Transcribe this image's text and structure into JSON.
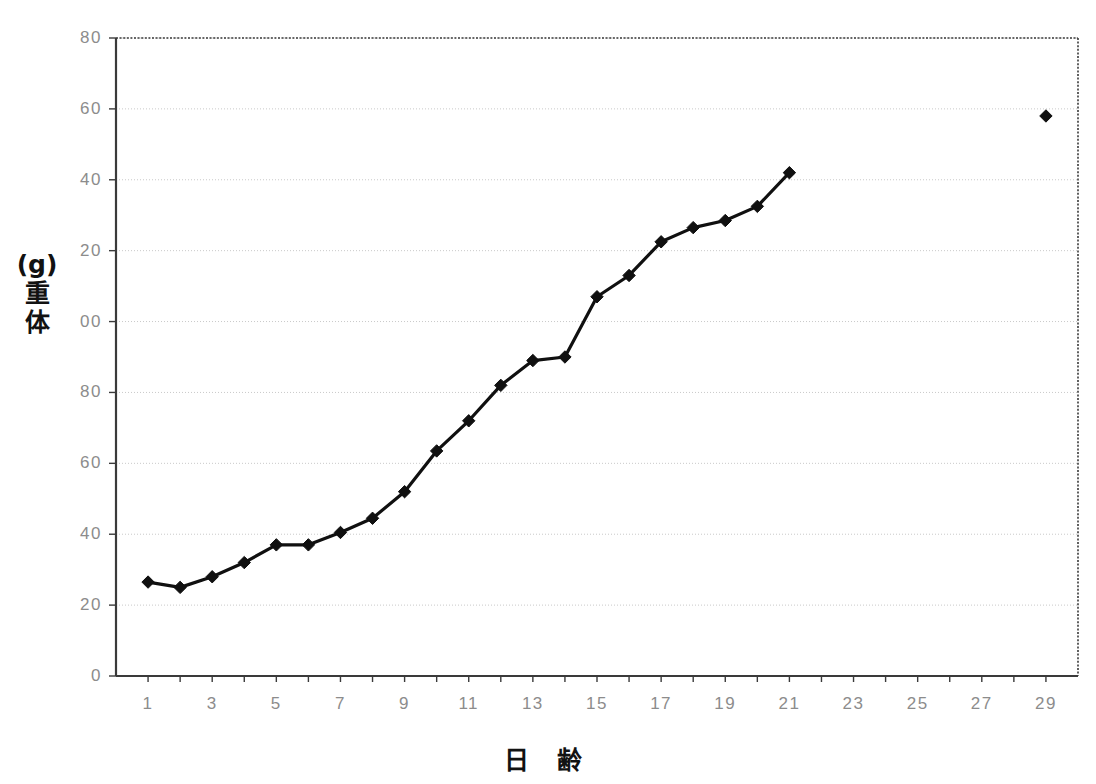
{
  "chart_data": {
    "type": "line",
    "title": "",
    "xlabel": "日 齢",
    "ylabel": "体 重 (g)",
    "xlim": [
      0,
      30
    ],
    "ylim": [
      0,
      180
    ],
    "grid": true,
    "legend_position": "none",
    "x_tick_step": 1,
    "x_tick_labels": [
      "1",
      "3",
      "5",
      "7",
      "9",
      "11",
      "13",
      "15",
      "17",
      "19",
      "21",
      "23",
      "25",
      "27",
      "29"
    ],
    "x_tick_label_values": [
      1,
      3,
      5,
      7,
      9,
      11,
      13,
      15,
      17,
      19,
      21,
      23,
      25,
      27,
      29
    ],
    "y_tick_labels": [
      "0",
      "20",
      "40",
      "60",
      "80",
      "100",
      "120",
      "140",
      "160",
      "180"
    ],
    "y_tick_values": [
      0,
      20,
      40,
      60,
      80,
      100,
      120,
      140,
      160,
      180
    ],
    "y_tick_labels_rendered": [
      "0",
      "20",
      "40",
      "60",
      "80",
      "00",
      "20",
      "40",
      "60",
      "80"
    ],
    "marker": "diamond",
    "marker_color": "#101010",
    "line_color": "#101010",
    "series": [
      {
        "name": "体重",
        "connected": true,
        "x": [
          1,
          2,
          3,
          4,
          5,
          6,
          7,
          8,
          9,
          10,
          11,
          12,
          13,
          14,
          15,
          16,
          17,
          18,
          19,
          20,
          21
        ],
        "values": [
          26.5,
          25,
          28,
          32,
          37,
          37,
          40.5,
          44.5,
          52,
          63.5,
          72,
          82,
          89,
          90,
          107,
          113,
          122.5,
          126.5,
          128.5,
          132.5,
          142
        ]
      },
      {
        "name": "体重 (29日齢)",
        "connected": false,
        "x": [
          29
        ],
        "values": [
          158
        ]
      }
    ]
  },
  "axes": {
    "frame_color": "#3a3a3a",
    "gridline_color": "#c9c9c9",
    "tick_label_color": "#8c8c8c",
    "axis_title_color": "#121212"
  },
  "y_axis_title_chars": [
    "体",
    "重",
    "(g)"
  ]
}
